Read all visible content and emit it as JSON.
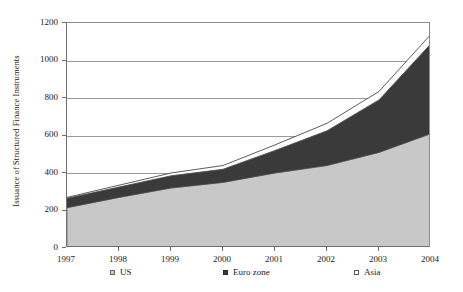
{
  "chart_data": {
    "type": "area",
    "stacked": true,
    "title": "",
    "xlabel": "",
    "ylabel": "Issuance of Structured Finance Instruments",
    "categories": [
      "1997",
      "1998",
      "1999",
      "2000",
      "2001",
      "2002",
      "2003",
      "2004"
    ],
    "x": [
      1997,
      1998,
      1999,
      2000,
      2001,
      2002,
      2003,
      2004
    ],
    "ylim": [
      0,
      1200
    ],
    "yticks": [
      0,
      200,
      400,
      600,
      800,
      1000,
      1200
    ],
    "ytick_labels": [
      "0",
      "200",
      "400",
      "600",
      "800",
      "1000",
      "1200"
    ],
    "grid": true,
    "grid_axis": "y",
    "legend_position": "bottom",
    "series": [
      {
        "name": "US",
        "color": "#c8c8c8",
        "values": [
          215,
          270,
          320,
          350,
          400,
          440,
          510,
          610
        ]
      },
      {
        "name": "Euro zone",
        "color": "#3a3a3a",
        "values": [
          50,
          55,
          65,
          70,
          120,
          185,
          280,
          480
        ]
      },
      {
        "name": "Asia",
        "color": "#ffffff",
        "values": [
          5,
          10,
          15,
          20,
          30,
          40,
          45,
          50
        ]
      }
    ],
    "cumulative_totals": [
      270,
      335,
      400,
      440,
      550,
      665,
      835,
      1140
    ]
  },
  "legend": {
    "items": [
      {
        "label": "US",
        "swatch": "square-filled-light-gray-icon"
      },
      {
        "label": "Euro zone",
        "swatch": "square-filled-dark-gray-icon"
      },
      {
        "label": "Asia",
        "swatch": "square-outline-white-icon"
      }
    ]
  }
}
